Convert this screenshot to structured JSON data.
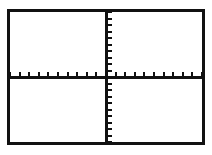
{
  "screen": {
    "label": "graphing-calculator-viewport",
    "background_color": "#ffffff",
    "frame_color": "#111111",
    "frame_thickness_px": 3,
    "axis_color": "#111111"
  },
  "chart_data": {
    "type": "scatter",
    "title": "",
    "subtitle": "",
    "xlabel": "",
    "ylabel": "",
    "legend": [],
    "annotations": [],
    "grid": false,
    "legend_position": "none",
    "series": [
      {
        "name": "empty-plot",
        "x": [],
        "y": [],
        "values": []
      }
    ],
    "x": [],
    "values": [],
    "categories": [],
    "xlim": [
      -10,
      10
    ],
    "ylim": [
      -10,
      10
    ],
    "x_tick_values": [
      -10,
      -9,
      -8,
      -7,
      -6,
      -5,
      -4,
      -3,
      -2,
      -1,
      1,
      2,
      3,
      4,
      5,
      6,
      7,
      8,
      9,
      10
    ],
    "y_tick_values": [
      -10,
      -9,
      -8,
      -7,
      -6,
      -5,
      -4,
      -3,
      -2,
      -1,
      1,
      2,
      3,
      4,
      5,
      6,
      7,
      8,
      9,
      10
    ],
    "x_tick_labels": [],
    "y_tick_labels": [],
    "x_tick_count": 20,
    "y_tick_count": 20,
    "x_tick_direction": "up",
    "y_tick_direction": "right",
    "x_tick_length_px": 4,
    "y_tick_length_px": 4,
    "axis_line_width_px": 3,
    "origin_fraction": {
      "x": 0.5,
      "y": 0.5
    }
  }
}
